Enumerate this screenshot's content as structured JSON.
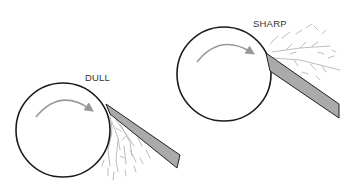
{
  "panels": [
    {
      "id": "dull",
      "label": "DULL",
      "wheel": {
        "cx": 63,
        "cy": 130,
        "r": 47,
        "rotation": "clockwise"
      },
      "blade": {
        "points": "106,104 180,155 177,168 110,114",
        "fill": "#aaaaaa",
        "stroke": "#222222"
      },
      "chip_direction": "downward"
    },
    {
      "id": "sharp",
      "label": "SHARP",
      "wheel": {
        "cx": 224,
        "cy": 74,
        "r": 47,
        "rotation": "clockwise"
      },
      "blade": {
        "points": "266,53 339,104 339,118 270,71",
        "fill": "#aaaaaa",
        "stroke": "#222222"
      },
      "chip_direction": "outward"
    }
  ],
  "colors": {
    "wheel_stroke": "#1a1a1a",
    "arrow": "#999999",
    "chips": "#b5b5b5"
  }
}
